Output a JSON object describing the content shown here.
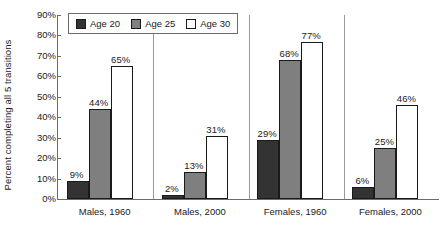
{
  "chart_data": {
    "type": "bar",
    "title": "",
    "subtitle": "",
    "xlabel": "",
    "ylabel": "Percent completing all 5 transitions",
    "ylim": [
      0,
      90
    ],
    "ytick_labels": [
      "0%",
      "10%",
      "20%",
      "30%",
      "40%",
      "50%",
      "60%",
      "70%",
      "80%",
      "90%"
    ],
    "ytick_values": [
      0,
      10,
      20,
      30,
      40,
      50,
      60,
      70,
      80,
      90
    ],
    "grid": false,
    "legend_position": "top-center",
    "group_separators": true,
    "value_labels_suffix": "%",
    "categories": [
      "Males, 1960",
      "Males, 2000",
      "Females, 1960",
      "Females, 2000"
    ],
    "series": [
      {
        "name": "Age 20",
        "color": "#333333",
        "values": [
          9,
          2,
          29,
          6
        ],
        "value_labels": [
          "9%",
          "2%",
          "29%",
          "6%"
        ]
      },
      {
        "name": "Age 25",
        "color": "#7f7f7f",
        "values": [
          44,
          13,
          68,
          25
        ],
        "value_labels": [
          "44%",
          "13%",
          "68%",
          "25%"
        ]
      },
      {
        "name": "Age 30",
        "color": "#ffffff",
        "values": [
          65,
          31,
          77,
          46
        ],
        "value_labels": [
          "65%",
          "31%",
          "77%",
          "46%"
        ]
      }
    ]
  },
  "legend": {
    "items": [
      {
        "label": "Age 20",
        "swatch": "age20"
      },
      {
        "label": "Age 25",
        "swatch": "age25"
      },
      {
        "label": "Age 30",
        "swatch": "age30"
      }
    ]
  },
  "colors": {
    "age20": "#333333",
    "age25": "#7f7f7f",
    "age30": "#ffffff",
    "axis": "#6b6b6b",
    "separator": "#9a9a9a",
    "text": "#1a1a1a",
    "background": "#ffffff"
  }
}
